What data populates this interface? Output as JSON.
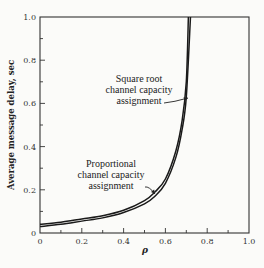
{
  "chart_data": {
    "type": "line",
    "title": "",
    "xlabel": "ρ",
    "ylabel": "Average message delay, sec",
    "xlim": [
      0,
      1.0
    ],
    "ylim": [
      0,
      1.0
    ],
    "x_ticks": [
      "0",
      "0.2",
      "0.4",
      "0.6",
      "0.8",
      "1.0"
    ],
    "y_ticks": [
      "0",
      "0.2",
      "0.4",
      "0.6",
      "0.8",
      "1.0"
    ],
    "grid": false,
    "legend": "inline annotations with arrows",
    "series": [
      {
        "name": "Proportional channel capacity assignment",
        "x": [
          0,
          0.1,
          0.2,
          0.3,
          0.4,
          0.5,
          0.55,
          0.6,
          0.65,
          0.68,
          0.7,
          0.71
        ],
        "y": [
          0.04,
          0.05,
          0.065,
          0.08,
          0.105,
          0.15,
          0.19,
          0.25,
          0.38,
          0.52,
          0.7,
          1.0
        ]
      },
      {
        "name": "Square root channel capacity assignment",
        "x": [
          0,
          0.1,
          0.2,
          0.3,
          0.4,
          0.5,
          0.55,
          0.6,
          0.65,
          0.68,
          0.7,
          0.72
        ],
        "y": [
          0.03,
          0.04,
          0.055,
          0.07,
          0.095,
          0.135,
          0.17,
          0.23,
          0.35,
          0.48,
          0.63,
          1.0
        ]
      }
    ],
    "annotations": [
      {
        "lines": [
          "Square root",
          "channel capacity",
          "assignment"
        ]
      },
      {
        "lines": [
          "Proportional",
          "channel capacity",
          "assignment"
        ]
      }
    ]
  },
  "labels": {
    "ylabel": "Average message delay, sec",
    "xlabel": "ρ",
    "annot_sqrt": [
      "Square root",
      "channel capacity",
      "assignment"
    ],
    "annot_prop": [
      "Proportional",
      "channel capacity",
      "assignment"
    ]
  }
}
